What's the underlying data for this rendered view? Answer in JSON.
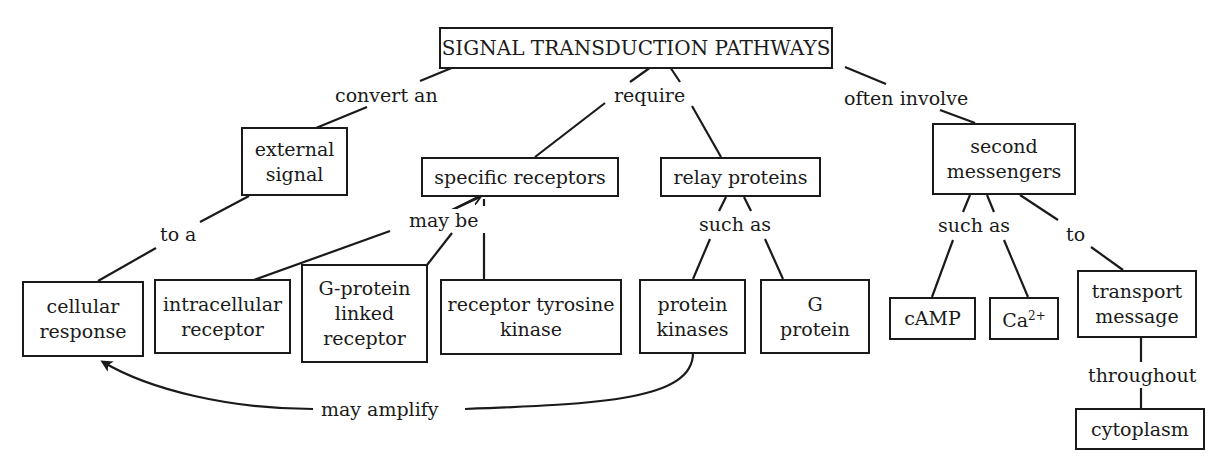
{
  "title": "SIGNAL TRANSDUCTION PATHWAYS",
  "nodes": {
    "root": "SIGNAL TRANSDUCTION PATHWAYS",
    "external_signal": "external\nsignal",
    "cellular_response": "cellular\nresponse",
    "specific_receptors": "specific receptors",
    "relay_proteins": "relay proteins",
    "second_messengers": "second\nmessengers",
    "intracellular_receptor": "intracellular\nreceptor",
    "g_protein_linked_receptor": "G-protein\nlinked\nreceptor",
    "receptor_tyrosine_kinase": "receptor tyrosine\nkinase",
    "protein_kinases": "protein\nkinases",
    "g_protein": "G\nprotein",
    "camp": "cAMP",
    "ca_base": "Ca",
    "ca_charge": "2+",
    "transport_message": "transport\nmessage",
    "cytoplasm": "cytoplasm"
  },
  "links": {
    "convert_an": "convert an",
    "require": "require",
    "often_involve": "often involve",
    "to_a": "to a",
    "may_be": "may be",
    "such_as_relay": "such as",
    "such_as_second": "such as",
    "to": "to",
    "throughout": "throughout",
    "may_amplify": "may amplify"
  }
}
